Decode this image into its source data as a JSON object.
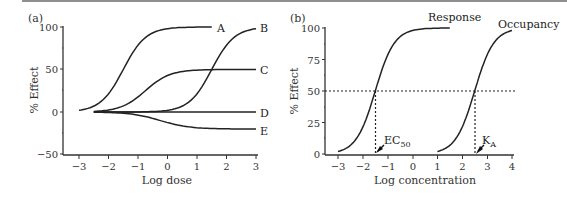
{
  "chart_data": [
    {
      "panel": "(a)",
      "type": "line",
      "title": "",
      "xlabel": "Log dose",
      "ylabel": "% Effect",
      "xlim": [
        -3,
        3
      ],
      "ylim": [
        -50,
        100
      ],
      "xticks": [
        -3,
        -2,
        -1,
        0,
        1,
        2,
        3
      ],
      "yticks": [
        -50,
        0,
        50,
        100
      ],
      "grid": false,
      "legend": "inline labels at right end of curves",
      "series": [
        {
          "name": "A",
          "x_start": -3,
          "x_end": 1.5,
          "max": 100,
          "min": 0,
          "midpoint": -1.5,
          "points": [
            [
              -3,
              0
            ],
            [
              -2,
              20
            ],
            [
              -1.5,
              50
            ],
            [
              -1,
              80
            ],
            [
              0,
              96
            ],
            [
              1.5,
              100
            ]
          ]
        },
        {
          "name": "B",
          "x_start": -2.5,
          "x_end": 3,
          "max": 100,
          "min": 0,
          "midpoint": 1.5,
          "points": [
            [
              -2.5,
              0
            ],
            [
              0,
              2
            ],
            [
              1,
              20
            ],
            [
              1.5,
              50
            ],
            [
              2,
              80
            ],
            [
              3,
              97
            ]
          ]
        },
        {
          "name": "C",
          "x_start": -2.5,
          "x_end": 3,
          "max": 50,
          "min": 0,
          "midpoint": -0.75,
          "points": [
            [
              -2.5,
              0
            ],
            [
              -1.5,
              8
            ],
            [
              -0.75,
              25
            ],
            [
              0,
              45
            ],
            [
              1,
              50
            ],
            [
              3,
              50
            ]
          ]
        },
        {
          "name": "D",
          "x_start": -2.5,
          "x_end": 3,
          "max": 0,
          "min": 0,
          "points": [
            [
              -2.5,
              0
            ],
            [
              3,
              0
            ]
          ]
        },
        {
          "name": "E",
          "x_start": -2.5,
          "x_end": 3,
          "max": -20,
          "min": 0,
          "midpoint": -0.25,
          "points": [
            [
              -2.5,
              0
            ],
            [
              -1,
              -4
            ],
            [
              -0.25,
              -10
            ],
            [
              0.5,
              -17
            ],
            [
              1.5,
              -20
            ],
            [
              3,
              -20
            ]
          ]
        }
      ]
    },
    {
      "panel": "(b)",
      "type": "line",
      "title": "",
      "xlabel": "Log concentration",
      "ylabel": "% Effect",
      "xlim": [
        -3,
        4
      ],
      "ylim": [
        0,
        100
      ],
      "xticks": [
        -3,
        -2,
        -1,
        0,
        1,
        2,
        3,
        4
      ],
      "yticks": [
        0,
        25,
        50,
        75,
        100
      ],
      "grid": false,
      "series": [
        {
          "name": "Response",
          "x_start": -3,
          "x_end": 1.5,
          "midpoint": -1.5,
          "max": 100,
          "points": [
            [
              -3,
              1
            ],
            [
              -2,
              20
            ],
            [
              -1.5,
              50
            ],
            [
              -1,
              78
            ],
            [
              0,
              96
            ],
            [
              1.5,
              100
            ]
          ]
        },
        {
          "name": "Occupancy",
          "x_start": 1,
          "x_end": 4,
          "midpoint": 2.5,
          "max": 100,
          "points": [
            [
              1,
              1
            ],
            [
              2,
              22
            ],
            [
              2.5,
              50
            ],
            [
              3,
              78
            ],
            [
              4,
              97
            ]
          ]
        }
      ],
      "reference_lines": [
        {
          "type": "horizontal",
          "y": 50,
          "style": "dotted"
        },
        {
          "type": "vertical",
          "x": -1.5,
          "y_to": 50,
          "style": "dotted"
        },
        {
          "type": "vertical",
          "x": 2.5,
          "y_to": 50,
          "style": "dotted"
        }
      ],
      "annotations": [
        {
          "text": "EC50",
          "x": -1.5,
          "arrow": true
        },
        {
          "text": "KA",
          "x": 2.5,
          "arrow": true
        }
      ]
    }
  ],
  "panel_a": {
    "label": "(a)",
    "xlabel": "Log dose",
    "ylabel": "% Effect",
    "yticks": [
      "100",
      "50",
      "0",
      "−50"
    ],
    "xticks": [
      "−3",
      "−2",
      "−1",
      "0",
      "1",
      "2",
      "3"
    ],
    "curve_labels": [
      "A",
      "B",
      "C",
      "D",
      "E"
    ]
  },
  "panel_b": {
    "label": "(b)",
    "xlabel": "Log concentration",
    "ylabel": "% Effect",
    "yticks": [
      "100",
      "75",
      "50",
      "25",
      "0"
    ],
    "xticks": [
      "−3",
      "−2",
      "−1",
      "0",
      "1",
      "2",
      "3",
      "4"
    ],
    "curve_labels": [
      "Response",
      "Occupancy"
    ],
    "ec50": {
      "main": "EC",
      "sub": "50"
    },
    "ka": {
      "main": "K",
      "sub": "A"
    }
  }
}
